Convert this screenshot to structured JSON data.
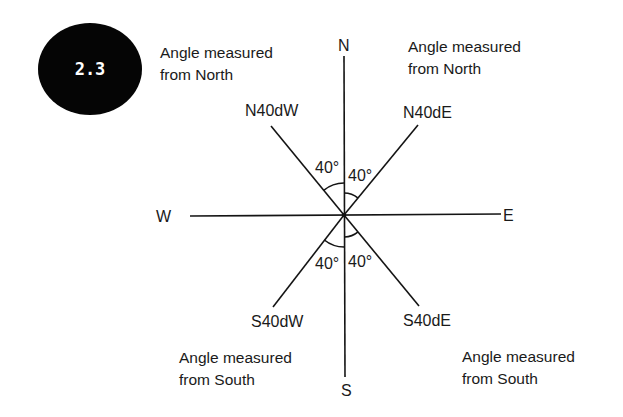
{
  "badge": {
    "label": "2.3",
    "color": "#050505",
    "text_color": "#ffffff"
  },
  "captions": {
    "top_left": {
      "line1": "Angle measured",
      "line2": "from North"
    },
    "top_right": {
      "line1": "Angle measured",
      "line2": "from North"
    },
    "bottom_left": {
      "line1": "Angle measured",
      "line2": "from South"
    },
    "bottom_right": {
      "line1": "Angle measured",
      "line2": "from South"
    }
  },
  "cardinals": {
    "north": "N",
    "south": "S",
    "east": "E",
    "west": "W"
  },
  "bearings": {
    "nw": "N40dW",
    "ne": "N40dE",
    "sw": "S40dW",
    "se": "S40dE"
  },
  "angles": {
    "nw": "40°",
    "ne": "40°",
    "sw": "40°",
    "se": "40°"
  },
  "line_color": "#141414"
}
